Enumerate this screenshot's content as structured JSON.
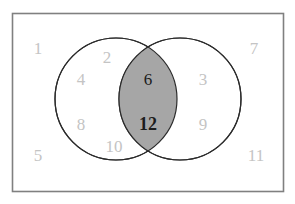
{
  "figure": {
    "type": "venn-diagram",
    "title": "",
    "universe_label": "",
    "background_color": "#ffffff",
    "frame": {
      "name": "universal-set-rectangle",
      "border_color": "#808080",
      "fill_color": "#ffffff",
      "x": 12,
      "y": 13,
      "width": 271,
      "height": 178
    },
    "colors": {
      "outside_number": "#c4c4c4",
      "inside_number": "#c4c4c4",
      "intersection_number": "#1c1c1c",
      "intersection_fill": "#a6a6a6",
      "circle_outline": "#2b2b2b",
      "circle_fill": "#ffffff"
    },
    "circles": [
      {
        "name": "left-circle",
        "cx": 116,
        "cy": 99,
        "r": 61,
        "fill": "#ffffff",
        "stroke": "#2b2b2b"
      },
      {
        "name": "right-circle",
        "cx": 180,
        "cy": 99,
        "r": 61,
        "fill": "#ffffff",
        "stroke": "#2b2b2b"
      }
    ]
  },
  "chart_data": {
    "type": "venn",
    "title": "",
    "xlabel": "",
    "ylabel": "",
    "sets": [
      {
        "name": "left-set",
        "region": "left-only",
        "members": [
          2,
          4,
          8,
          10
        ]
      },
      {
        "name": "right-set",
        "region": "right-only",
        "members": [
          3,
          9
        ]
      },
      {
        "name": "intersection",
        "region": "both",
        "members": [
          6,
          12
        ],
        "highlighted": true,
        "fill": "#a6a6a6"
      },
      {
        "name": "outside",
        "region": "neither",
        "members": [
          1,
          5,
          7,
          11
        ]
      }
    ],
    "legend": []
  },
  "labels": [
    {
      "id": "n1",
      "text": "1",
      "x": 38,
      "y": 48,
      "region": "outside",
      "style": "outside"
    },
    {
      "id": "n2",
      "text": "2",
      "x": 107,
      "y": 57,
      "region": "left-only",
      "style": "outside"
    },
    {
      "id": "n4",
      "text": "4",
      "x": 81,
      "y": 79,
      "region": "left-only",
      "style": "outside"
    },
    {
      "id": "n8",
      "text": "8",
      "x": 81,
      "y": 124,
      "region": "left-only",
      "style": "outside"
    },
    {
      "id": "n10",
      "text": "10",
      "x": 114,
      "y": 146,
      "region": "left-only",
      "style": "outside"
    },
    {
      "id": "n5",
      "text": "5",
      "x": 38,
      "y": 155,
      "region": "outside",
      "style": "outside"
    },
    {
      "id": "n6",
      "text": "6",
      "x": 148,
      "y": 79,
      "region": "intersection",
      "style": "inner"
    },
    {
      "id": "n12",
      "text": "12",
      "x": 148,
      "y": 124,
      "region": "intersection",
      "style": "bold"
    },
    {
      "id": "n3",
      "text": "3",
      "x": 203,
      "y": 79,
      "region": "right-only",
      "style": "outside"
    },
    {
      "id": "n9",
      "text": "9",
      "x": 203,
      "y": 124,
      "region": "right-only",
      "style": "outside"
    },
    {
      "id": "n7",
      "text": "7",
      "x": 254,
      "y": 48,
      "region": "outside",
      "style": "outside"
    },
    {
      "id": "n11",
      "text": "11",
      "x": 256,
      "y": 155,
      "region": "outside",
      "style": "outside"
    }
  ]
}
